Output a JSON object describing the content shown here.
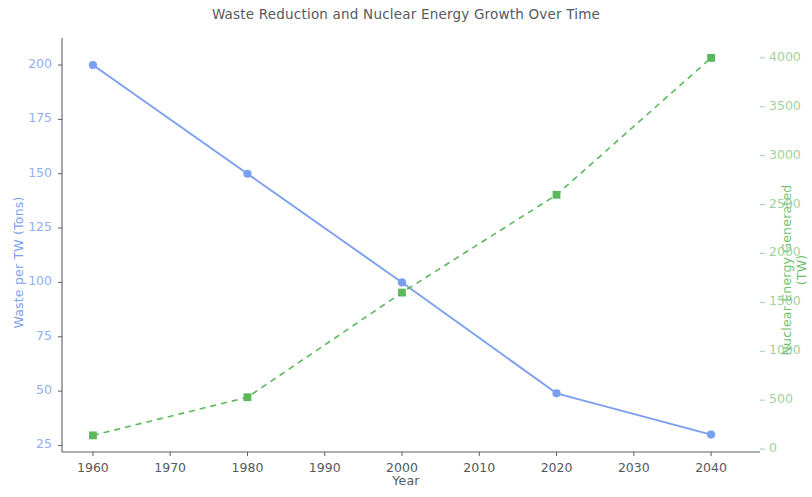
{
  "chart_data": {
    "type": "line",
    "title": "Waste Reduction and Nuclear Energy Growth Over Time",
    "xlabel": "Year",
    "x": [
      1960,
      1980,
      2000,
      2020,
      2040
    ],
    "xlim": [
      1956,
      2044
    ],
    "xticks": [
      1960,
      1970,
      1980,
      1990,
      2000,
      2010,
      2020,
      2030,
      2040
    ],
    "xticklabels": [
      "1960",
      "1970",
      "1980",
      "1990",
      "2000",
      "2010",
      "2020",
      "2030",
      "2040"
    ],
    "grid": false,
    "legend": "none",
    "series": [
      {
        "name": "Waste per TW (Tons)",
        "axis": "left",
        "values": [
          200,
          150,
          100,
          49,
          30
        ],
        "color": "#7b9ff0",
        "linestyle": "solid",
        "marker": "circle",
        "ylabel": "Waste per TW (Tons)",
        "ylim": [
          22,
          206
        ],
        "yticks": [
          25,
          50,
          75,
          100,
          125,
          150,
          175,
          200
        ],
        "yticklabels": [
          "25",
          "50",
          "75",
          "100",
          "125",
          "150",
          "175",
          "200"
        ]
      },
      {
        "name": "Nuclear Energy Generated (TW)",
        "axis": "right",
        "values": [
          140,
          530,
          1600,
          2600,
          4000
        ],
        "color": "#5cb85c",
        "linestyle": "dashed",
        "marker": "square",
        "ylabel": "Nuclear Energy Generated (TW)",
        "ylim": [
          -30,
          4060
        ],
        "yticks": [
          0,
          500,
          1000,
          1500,
          2000,
          2500,
          3000,
          3500,
          4000
        ],
        "yticklabels": [
          "0",
          "500",
          "1000",
          "1500",
          "2000",
          "2500",
          "3000",
          "3500",
          "4000"
        ]
      }
    ]
  }
}
